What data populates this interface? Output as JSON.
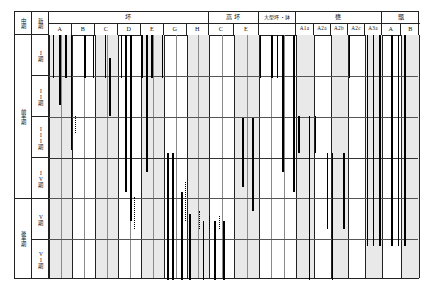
{
  "figure": {
    "title": "",
    "type": "seriation-range-chart"
  },
  "row_header": {
    "col1_label": "中期",
    "col2_label": "新期",
    "major_groups": [
      {
        "label": "前半期",
        "rows": [
          "I期",
          "II期",
          "III期",
          "IV期"
        ]
      },
      {
        "label": "後半期",
        "rows": [
          "V期",
          "VI期"
        ]
      }
    ],
    "stage_labels": [
      "I",
      "期",
      "II",
      "期",
      "III",
      "期",
      "IV",
      "期",
      "V",
      "期",
      "VI",
      "期"
    ]
  },
  "column_groups": [
    {
      "label": "坏",
      "columns": [
        "A",
        "B",
        "C",
        "D",
        "E",
        "G",
        "H"
      ]
    },
    {
      "label": "高 坏",
      "columns": [
        "C",
        "E"
      ]
    },
    {
      "label": "大型坏・鉢",
      "columns": [
        ""
      ]
    },
    {
      "label": "甕",
      "columns": [
        "A1a",
        "A2a",
        "A2b",
        "A2c",
        "A3a"
      ]
    },
    {
      "label": "甑",
      "columns": [
        "A",
        "B"
      ]
    }
  ],
  "chart_data": {
    "type": "range-bar-seriation",
    "xlabel": "",
    "ylabel": "",
    "row_categories": [
      "I期",
      "II期",
      "III期",
      "IV期",
      "V期",
      "VI期"
    ],
    "grid": true,
    "legend": "none",
    "colors": {
      "bar": "#000000",
      "band": "#e9e9e9",
      "grid": "#555555",
      "frame": "#222222"
    },
    "series": [
      {
        "group": "坏",
        "column": "A",
        "bars": [
          {
            "x": 0.01,
            "y0": 0.0,
            "y1": 0.175,
            "style": "solid"
          }
        ]
      },
      {
        "group": "坏",
        "column": "A",
        "bars": [
          {
            "x": 0.028,
            "y0": 0.0,
            "y1": 0.285,
            "style": "solid"
          }
        ]
      },
      {
        "group": "坏",
        "column": "A",
        "bars": [
          {
            "x": 0.044,
            "y0": 0.0,
            "y1": 0.175,
            "style": "solid"
          }
        ]
      },
      {
        "group": "坏",
        "column": "A",
        "bars": [
          {
            "x": 0.058,
            "y0": 0.0,
            "y1": 0.47,
            "style": "solid"
          }
        ]
      },
      {
        "group": "坏",
        "column": "A",
        "bars": [
          {
            "x": 0.07,
            "y0": 0.33,
            "y1": 0.4,
            "style": "dotted"
          }
        ]
      },
      {
        "group": "坏",
        "column": "B",
        "bars": [
          {
            "x": 0.095,
            "y0": 0.0,
            "y1": 0.175,
            "style": "solid"
          }
        ]
      },
      {
        "group": "坏",
        "column": "B",
        "bars": [
          {
            "x": 0.118,
            "y0": 0.0,
            "y1": 0.175,
            "style": "solid"
          }
        ]
      },
      {
        "group": "坏",
        "column": "C",
        "bars": [
          {
            "x": 0.15,
            "y0": 0.0,
            "y1": 0.175,
            "style": "solid"
          }
        ]
      },
      {
        "group": "坏",
        "column": "C",
        "bars": [
          {
            "x": 0.162,
            "y0": 0.095,
            "y1": 0.33,
            "style": "solid"
          }
        ]
      },
      {
        "group": "坏",
        "column": "D",
        "bars": [
          {
            "x": 0.193,
            "y0": 0.0,
            "y1": 0.175,
            "style": "solid"
          }
        ]
      },
      {
        "group": "坏",
        "column": "D",
        "bars": [
          {
            "x": 0.206,
            "y0": 0.0,
            "y1": 0.64,
            "style": "solid"
          }
        ]
      },
      {
        "group": "坏",
        "column": "D",
        "bars": [
          {
            "x": 0.218,
            "y0": 0.0,
            "y1": 0.76,
            "style": "solid"
          }
        ]
      },
      {
        "group": "坏",
        "column": "D",
        "bars": [
          {
            "x": 0.228,
            "y0": 0.66,
            "y1": 0.79,
            "style": "dotted"
          }
        ]
      },
      {
        "group": "坏",
        "column": "E",
        "bars": [
          {
            "x": 0.248,
            "y0": 0.0,
            "y1": 0.175,
            "style": "solid"
          }
        ]
      },
      {
        "group": "坏",
        "column": "E",
        "bars": [
          {
            "x": 0.262,
            "y0": 0.0,
            "y1": 0.56,
            "style": "solid"
          }
        ]
      },
      {
        "group": "坏",
        "column": "E",
        "bars": [
          {
            "x": 0.276,
            "y0": 0.0,
            "y1": 0.175,
            "style": "solid"
          }
        ]
      },
      {
        "group": "坏",
        "column": "G",
        "bars": [
          {
            "x": 0.304,
            "y0": 0.0,
            "y1": 0.175,
            "style": "solid"
          }
        ]
      },
      {
        "group": "坏",
        "column": "G",
        "bars": [
          {
            "x": 0.318,
            "y0": 0.48,
            "y1": 1.0,
            "style": "solid"
          }
        ]
      },
      {
        "group": "坏",
        "column": "G",
        "bars": [
          {
            "x": 0.332,
            "y0": 0.48,
            "y1": 1.0,
            "style": "solid"
          }
        ]
      },
      {
        "group": "坏",
        "column": "H",
        "bars": [
          {
            "x": 0.356,
            "y0": 0.64,
            "y1": 1.0,
            "style": "solid"
          }
        ]
      },
      {
        "group": "坏",
        "column": "H",
        "bars": [
          {
            "x": 0.366,
            "y0": 0.6,
            "y1": 0.76,
            "style": "dotted"
          }
        ]
      },
      {
        "group": "坏",
        "column": "H",
        "bars": [
          {
            "x": 0.378,
            "y0": 0.73,
            "y1": 1.0,
            "style": "solid"
          }
        ]
      },
      {
        "group": "高坏",
        "column": "C",
        "bars": [
          {
            "x": 0.404,
            "y0": 0.72,
            "y1": 0.79,
            "style": "dotted"
          }
        ]
      },
      {
        "group": "高坏",
        "column": "C",
        "bars": [
          {
            "x": 0.414,
            "y0": 0.76,
            "y1": 1.0,
            "style": "solid"
          }
        ]
      },
      {
        "group": "高坏",
        "column": "C",
        "bars": [
          {
            "x": 0.43,
            "y0": 0.74,
            "y1": 0.79,
            "style": "dotted"
          }
        ]
      },
      {
        "group": "高坏",
        "column": "E",
        "bars": [
          {
            "x": 0.446,
            "y0": 0.76,
            "y1": 1.0,
            "style": "solid"
          }
        ]
      },
      {
        "group": "高坏",
        "column": "E",
        "bars": [
          {
            "x": 0.458,
            "y0": 0.74,
            "y1": 0.79,
            "style": "dotted"
          }
        ]
      },
      {
        "group": "高坏",
        "column": "E",
        "bars": [
          {
            "x": 0.47,
            "y0": 0.76,
            "y1": 1.0,
            "style": "solid"
          }
        ]
      },
      {
        "group": "大型坏・鉢",
        "column": "",
        "bars": [
          {
            "x": 0.52,
            "y0": 0.34,
            "y1": 0.62,
            "style": "solid"
          }
        ]
      },
      {
        "group": "大型坏・鉢",
        "column": "",
        "bars": [
          {
            "x": 0.548,
            "y0": 0.34,
            "y1": 0.72,
            "style": "solid"
          }
        ]
      },
      {
        "group": "大型坏・鉢",
        "column": "",
        "bars": [
          {
            "x": 0.568,
            "y0": 0.0,
            "y1": 0.175,
            "style": "solid"
          }
        ]
      },
      {
        "group": "甕",
        "column": "A1a",
        "bars": [
          {
            "x": 0.598,
            "y0": 0.0,
            "y1": 0.175,
            "style": "solid"
          }
        ]
      },
      {
        "group": "甕",
        "column": "A1a",
        "bars": [
          {
            "x": 0.614,
            "y0": 0.0,
            "y1": 0.175,
            "style": "solid"
          }
        ]
      },
      {
        "group": "甕",
        "column": "A1a",
        "bars": [
          {
            "x": 0.628,
            "y0": 0.0,
            "y1": 0.56,
            "style": "solid"
          }
        ]
      },
      {
        "group": "甕",
        "column": "A2a",
        "bars": [
          {
            "x": 0.658,
            "y0": 0.0,
            "y1": 0.64,
            "style": "solid"
          }
        ]
      },
      {
        "group": "甕",
        "column": "A2a",
        "bars": [
          {
            "x": 0.672,
            "y0": 0.33,
            "y1": 0.48,
            "style": "solid"
          }
        ]
      },
      {
        "group": "甕",
        "column": "A2b",
        "bars": [
          {
            "x": 0.7,
            "y0": 0.33,
            "y1": 1.0,
            "style": "solid"
          }
        ]
      },
      {
        "group": "甕",
        "column": "A2b",
        "bars": [
          {
            "x": 0.716,
            "y0": 0.33,
            "y1": 0.48,
            "style": "solid"
          }
        ]
      },
      {
        "group": "甕",
        "column": "A2c",
        "bars": [
          {
            "x": 0.748,
            "y0": 0.48,
            "y1": 0.79,
            "style": "solid"
          }
        ]
      },
      {
        "group": "甕",
        "column": "A2c",
        "bars": [
          {
            "x": 0.762,
            "y0": 0.48,
            "y1": 1.0,
            "style": "solid"
          }
        ]
      },
      {
        "group": "甕",
        "column": "A3a",
        "bars": [
          {
            "x": 0.792,
            "y0": 0.48,
            "y1": 0.79,
            "style": "solid"
          }
        ]
      },
      {
        "group": "甕",
        "column": "A3a",
        "bars": [
          {
            "x": 0.808,
            "y0": 0.0,
            "y1": 0.175,
            "style": "solid"
          }
        ]
      },
      {
        "group": "甑",
        "column": "A",
        "bars": [
          {
            "x": 0.856,
            "y0": 0.0,
            "y1": 0.86,
            "style": "solid"
          }
        ]
      },
      {
        "group": "甑",
        "column": "A",
        "bars": [
          {
            "x": 0.872,
            "y0": 0.0,
            "y1": 0.86,
            "style": "solid"
          }
        ]
      },
      {
        "group": "甑",
        "column": "A",
        "bars": [
          {
            "x": 0.89,
            "y0": 0.0,
            "y1": 0.86,
            "style": "solid"
          }
        ]
      },
      {
        "group": "甑",
        "column": "B",
        "bars": [
          {
            "x": 0.922,
            "y0": 0.0,
            "y1": 0.86,
            "style": "solid"
          }
        ]
      },
      {
        "group": "甑",
        "column": "B",
        "bars": [
          {
            "x": 0.94,
            "y0": 0.0,
            "y1": 0.86,
            "style": "solid"
          }
        ]
      },
      {
        "group": "甑",
        "column": "B",
        "bars": [
          {
            "x": 0.958,
            "y0": 0.0,
            "y1": 0.86,
            "style": "solid"
          }
        ]
      }
    ]
  }
}
